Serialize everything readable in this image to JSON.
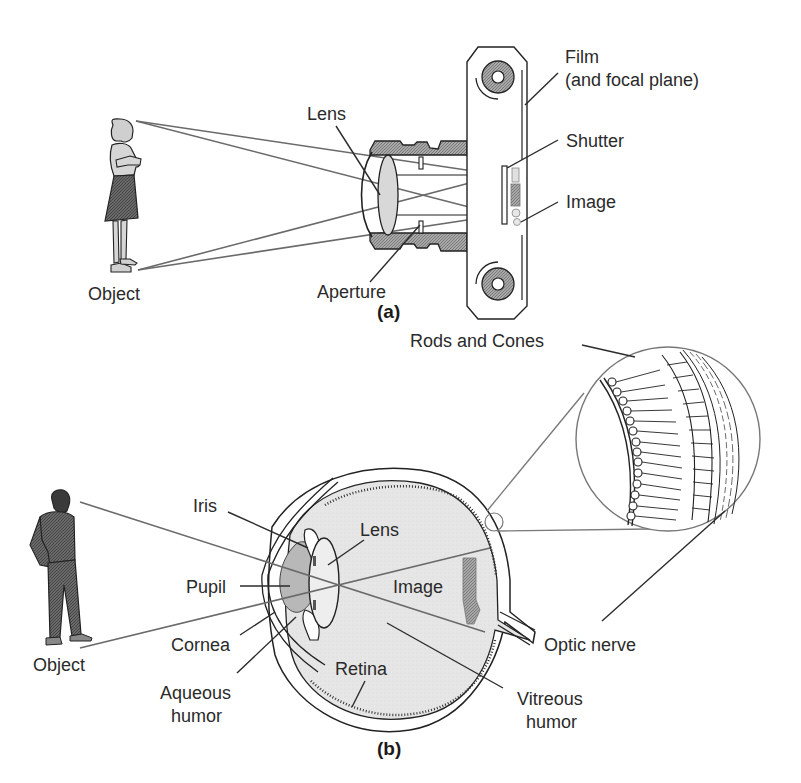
{
  "figure": {
    "panel_a": {
      "caption": "(a)",
      "labels": {
        "object": "Object",
        "lens": "Lens",
        "aperture": "Aperture",
        "film_line1": "Film",
        "film_line2": "(and focal plane)",
        "shutter": "Shutter",
        "image": "Image"
      }
    },
    "panel_b": {
      "caption": "(b)",
      "labels": {
        "rods_cones": "Rods and Cones",
        "iris": "Iris",
        "lens": "Lens",
        "pupil": "Pupil",
        "image": "Image",
        "cornea": "Cornea",
        "aqueous_line1": "Aqueous",
        "aqueous_line2": "humor",
        "object": "Object",
        "retina": "Retina",
        "optic_nerve": "Optic nerve",
        "vitreous_line1": "Vitreous",
        "vitreous_line2": "humor"
      }
    },
    "colors": {
      "lens_fill": "#d8d8d8",
      "hatch_fill": "#9a9a9a",
      "eye_fill": "#e4e4e4",
      "pupil_fill": "#b8b8b8",
      "ray": "#6a6a6a"
    }
  }
}
